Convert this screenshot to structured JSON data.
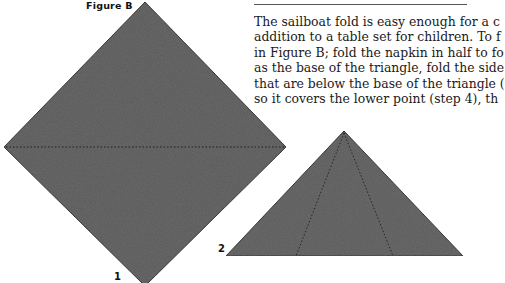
{
  "figure": {
    "title": "Figure B",
    "steps": [
      {
        "number": "1",
        "shape": "diamond-square",
        "fold_line": "horizontal-dotted"
      },
      {
        "number": "2",
        "shape": "triangle",
        "fold_lines": "two-dotted-from-apex"
      }
    ]
  },
  "colors": {
    "napkin_fill": "#5a5a5a",
    "outline": "#222222",
    "fold_line": "#1e1e1e"
  },
  "text": {
    "lines": [
      "The sailboat fold is easy enough for a c",
      "addition to a table set for children. To f",
      "in Figure B; fold the napkin in half to fo",
      "as the base of the triangle, fold the side",
      "that are below the base of the triangle (",
      "so it covers the lower point (step 4), th"
    ]
  }
}
